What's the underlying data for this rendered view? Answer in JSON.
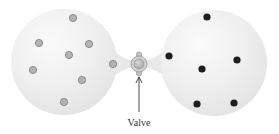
{
  "diagram": {
    "valve_label": "Valve",
    "colors": {
      "flask_fill": "#ececec",
      "flask_highlight": "#f8f8f8",
      "flask_edge": "#dcdcdc",
      "gray_particle_fill": "#b4b4b4",
      "gray_particle_stroke": "#7a7a7a",
      "black_particle_fill": "#1e1e1e",
      "valve_outer": "#cfcfcf",
      "valve_inner": "#b8b8b8",
      "valve_stroke": "#8c8c8c",
      "arrow": "#333333"
    },
    "left_flask": {
      "name": "left flask",
      "particle_type": "gray",
      "particle_count": 8,
      "center": [
        64,
        62
      ],
      "radius": 53,
      "particles": [
        [
          73,
          18
        ],
        [
          39,
          43
        ],
        [
          89,
          44
        ],
        [
          69,
          55
        ],
        [
          33,
          70
        ],
        [
          113,
          64
        ],
        [
          82,
          80
        ],
        [
          64,
          102
        ]
      ]
    },
    "right_flask": {
      "name": "right flask",
      "particle_type": "black",
      "particle_count": 6,
      "center": [
        214,
        63
      ],
      "radius": 53,
      "particles": [
        [
          207,
          17
        ],
        [
          169,
          56
        ],
        [
          237,
          60
        ],
        [
          202,
          69
        ],
        [
          197,
          104
        ],
        [
          234,
          103
        ]
      ]
    },
    "valve": {
      "center": [
        139,
        64
      ],
      "outer_radius": 8,
      "inner_radius": 5
    },
    "arrow": {
      "from": [
        139,
        112
      ],
      "to": [
        139,
        77
      ]
    },
    "label_position": [
      139,
      117
    ]
  }
}
